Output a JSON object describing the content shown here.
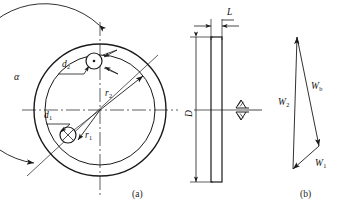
{
  "figure": {
    "type": "engineering-drawing",
    "background_color": "#ffffff",
    "line_color": "#1a1a1a"
  },
  "panel_a": {
    "caption": "(a)",
    "labels": {
      "alpha": "α",
      "d1": "d",
      "d1_sub": "1",
      "d2": "d",
      "d2_sub": "2",
      "r1": "r",
      "r1_sub": "1",
      "r2": "r",
      "r2_sub": "2"
    },
    "geometry": {
      "center_x": 100,
      "center_y": 110,
      "main_circle_radius": 66,
      "inner_circle_radius": 55,
      "outer_arc_radius": 80,
      "weight1_center": [
        68,
        135
      ],
      "weight1_radius": 8,
      "weight2_center": [
        94,
        61
      ],
      "weight2_radius": 8
    }
  },
  "panel_side": {
    "labels": {
      "L": "L",
      "D": "D"
    },
    "surface_marks": [
      "surface-finish-triangle-upper",
      "surface-finish-triangle-lower"
    ],
    "geometry": {
      "rect_left": 211,
      "rect_right": 222,
      "rect_top": 37,
      "rect_bottom": 182
    }
  },
  "panel_b": {
    "caption": "(b)",
    "labels": {
      "W1": "W",
      "W1_sub": "1",
      "W2": "W",
      "W2_sub": "2",
      "Wb": "W",
      "Wb_sub": "b"
    },
    "geometry": {
      "apex": [
        297,
        37
      ],
      "bottom_left": [
        293,
        169
      ],
      "right_vertex": [
        319,
        146
      ]
    }
  }
}
